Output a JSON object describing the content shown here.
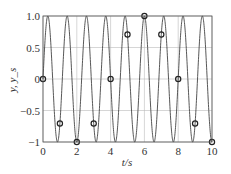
{
  "chart_data": {
    "type": "line",
    "title": "",
    "xlabel": "t/s",
    "ylabel": "y, y_s",
    "xlim": [
      0,
      10
    ],
    "ylim": [
      -1,
      1
    ],
    "grid": true,
    "xticks": [
      0,
      2,
      4,
      6,
      8,
      10
    ],
    "yticks": [
      -1,
      -0.5,
      0,
      0.5,
      1.0
    ],
    "xtick_labels": [
      "0",
      "2",
      "4",
      "6",
      "8",
      "10"
    ],
    "ytick_labels": [
      "−1",
      "−0.5",
      "0",
      "0.5",
      "1.0"
    ],
    "series": [
      {
        "name": "y (continuous)",
        "style": "line",
        "formula": "sin(2*pi*0.875*t)",
        "frequency_hz": 0.875
      },
      {
        "name": "y_s (samples)",
        "style": "circle-markers",
        "x": [
          0,
          1,
          2,
          3,
          4,
          5,
          6,
          7,
          8,
          9,
          10
        ],
        "values": [
          0,
          -0.707,
          -1,
          -0.707,
          0,
          0.707,
          1,
          0.707,
          0,
          -0.707,
          -1
        ]
      }
    ]
  },
  "colors": {
    "line": "#444444",
    "grid": "#bbbbbb",
    "marker": "#222222"
  }
}
